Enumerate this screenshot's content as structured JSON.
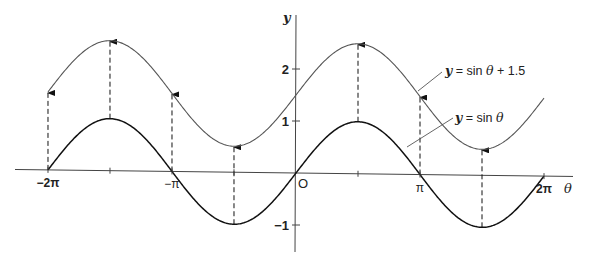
{
  "chart_data": {
    "type": "line",
    "title": "",
    "xlabel": "θ",
    "ylabel": "y",
    "origin_label": "O",
    "x_ticks": [
      {
        "value": -6.2832,
        "label": "−2π"
      },
      {
        "value": -4.7124,
        "label": ""
      },
      {
        "value": -3.1416,
        "label": "−π"
      },
      {
        "value": -1.5708,
        "label": ""
      },
      {
        "value": 1.5708,
        "label": ""
      },
      {
        "value": 3.1416,
        "label": "π"
      },
      {
        "value": 6.2832,
        "label": "2π"
      }
    ],
    "y_ticks": [
      {
        "value": 2,
        "label": "2"
      },
      {
        "value": 1,
        "label": "1"
      },
      {
        "value": -1,
        "label": "−1"
      }
    ],
    "xlim": [
      -6.28,
      6.28
    ],
    "ylim": [
      -1.5,
      2.7
    ],
    "grid": false,
    "series": [
      {
        "name": "y = sin θ + 1.5",
        "function": "sin(θ) + 1.5",
        "domain": [
          -6.2832,
          6.2832
        ],
        "x": [
          -6.2832,
          -4.7124,
          -3.1416,
          -1.5708,
          0,
          1.5708,
          3.1416,
          4.7124,
          6.2832
        ],
        "values": [
          1.5,
          2.5,
          1.5,
          0.5,
          1.5,
          2.5,
          1.5,
          0.5,
          1.5
        ],
        "color": "#555555"
      },
      {
        "name": "y = sin θ",
        "function": "sin(θ)",
        "domain": [
          -6.2832,
          6.2832
        ],
        "x": [
          -6.2832,
          -4.7124,
          -3.1416,
          -1.5708,
          0,
          1.5708,
          3.1416,
          4.7124,
          6.2832
        ],
        "values": [
          0,
          1,
          0,
          -1,
          0,
          1,
          0,
          -1,
          0
        ],
        "color": "#111111"
      }
    ],
    "translation_arrows": {
      "shift": 1.5,
      "style": "dashed",
      "x_positions": [
        -6.2832,
        -4.7124,
        -3.1416,
        -1.5708,
        1.5708,
        3.1416,
        4.7124
      ]
    },
    "annotations": [
      {
        "text": "y = sin θ + 1.5",
        "target_series": 0
      },
      {
        "text": "y = sin θ",
        "target_series": 1
      }
    ]
  }
}
